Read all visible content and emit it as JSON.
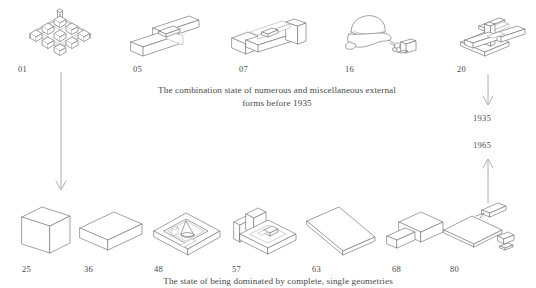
{
  "diagram": {
    "top_row": [
      {
        "id": "01",
        "label": "01",
        "shape": "cube-lattice-grid"
      },
      {
        "id": "05",
        "label": "05",
        "shape": "crossed-beams-l-form"
      },
      {
        "id": "07",
        "label": "07",
        "shape": "walled-frame-enclosure"
      },
      {
        "id": "16",
        "label": "16",
        "shape": "organic-blob-with-fragments"
      },
      {
        "id": "20",
        "label": "20",
        "shape": "crossing-bar-assembly"
      }
    ],
    "bottom_row": [
      {
        "id": "25",
        "label": "25",
        "shape": "upright-rectangular-block"
      },
      {
        "id": "36",
        "label": "36",
        "shape": "flat-horizontal-slab"
      },
      {
        "id": "48",
        "label": "48",
        "shape": "square-basin-with-cone"
      },
      {
        "id": "57",
        "label": "57",
        "shape": "open-walled-tray"
      },
      {
        "id": "63",
        "label": "63",
        "shape": "long-thin-bar"
      },
      {
        "id": "68",
        "label": "68",
        "shape": "l-shaped-block"
      },
      {
        "id": "80",
        "label": "80",
        "shape": "flat-plate-with-small-pieces"
      }
    ],
    "captions": {
      "top_line_1": "The combination state of numerous and miscellaneous external",
      "top_line_2": "forms before 1935",
      "bottom": "The state of being dominated by complete, single geometries"
    },
    "years": {
      "earlier": "1935",
      "later": "1965"
    },
    "arrows": {
      "left_down": "arrow-down-from-01-to-25",
      "right_down": "arrow-down-from-20-to-1935",
      "right_up": "arrow-up-from-80-to-1965"
    },
    "colors": {
      "background": "#ffffff",
      "stroke": "#7a7a7a",
      "stroke_faint": "#a8a8a8",
      "text": "#4a4a4a",
      "arrow": "#9a9a9a"
    }
  }
}
